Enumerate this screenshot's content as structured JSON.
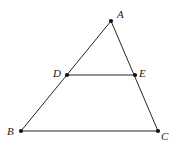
{
  "figure": {
    "type": "geometry-diagram",
    "width": 181,
    "height": 159,
    "background_color": "#ffffff",
    "stroke_color": "#262626",
    "stroke_width": 1,
    "vertex_dot_color": "#111111",
    "vertex_dot_radius": 2.1,
    "label_color": "#1a1a1a",
    "label_font_size": 11,
    "points": [
      {
        "id": "A",
        "label": "A",
        "x": 111,
        "y": 21,
        "label_x": 117,
        "label_y": 9,
        "dot": true
      },
      {
        "id": "B",
        "label": "B",
        "x": 21,
        "y": 131,
        "label_x": 7,
        "label_y": 126,
        "dot": true
      },
      {
        "id": "C",
        "label": "C",
        "x": 158,
        "y": 131,
        "label_x": 161,
        "label_y": 131,
        "dot": true
      },
      {
        "id": "D",
        "label": "D",
        "x": 67,
        "y": 75,
        "label_x": 53,
        "label_y": 68,
        "dot": true
      },
      {
        "id": "E",
        "label": "E",
        "x": 135,
        "y": 75,
        "label_x": 139,
        "label_y": 68,
        "dot": true
      }
    ],
    "segments": [
      {
        "id": "AB",
        "from": "A",
        "to": "B",
        "x1": 111,
        "y1": 21,
        "x2": 21,
        "y2": 131
      },
      {
        "id": "AC",
        "from": "A",
        "to": "C",
        "x1": 111,
        "y1": 21,
        "x2": 158,
        "y2": 131
      },
      {
        "id": "BC",
        "from": "B",
        "to": "C",
        "x1": 21,
        "y1": 131,
        "x2": 158,
        "y2": 131
      },
      {
        "id": "DE",
        "from": "D",
        "to": "E",
        "x1": 67,
        "y1": 75,
        "x2": 135,
        "y2": 75
      }
    ]
  }
}
